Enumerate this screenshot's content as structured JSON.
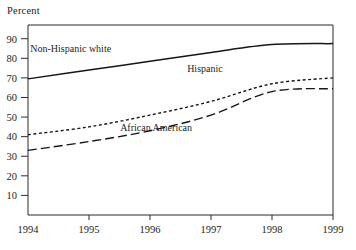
{
  "chart_data": {
    "type": "line",
    "title": "",
    "ylabel": "Percent",
    "xlabel": "",
    "x": [
      1994,
      1995,
      1996,
      1997,
      1998,
      1999
    ],
    "xtick_labels": [
      "1994",
      "1995",
      "1996",
      "1997",
      "1998",
      "1999"
    ],
    "ytick_labels": [
      "10",
      "20",
      "30",
      "40",
      "50",
      "60",
      "70",
      "80",
      "90"
    ],
    "ytick_values": [
      10,
      20,
      30,
      40,
      50,
      60,
      70,
      80,
      90
    ],
    "ylim": [
      0,
      97
    ],
    "xlim": [
      1994,
      1999
    ],
    "grid": false,
    "legend_position": "inline-annotations",
    "series": [
      {
        "name": "Non-Hispanic white",
        "style": "solid",
        "color": "#161616",
        "label_x": 1994.7,
        "label_y": 83,
        "values": [
          69.5,
          74,
          78.5,
          83,
          87,
          87.5
        ]
      },
      {
        "name": "Hispanic",
        "style": "dotted",
        "color": "#161616",
        "label_x": 1996.9,
        "label_y": 73,
        "values": [
          41,
          45,
          51,
          58,
          67,
          70
        ]
      },
      {
        "name": "African American",
        "style": "dashed",
        "color": "#161616",
        "label_x": 1996.1,
        "label_y": 43,
        "values": [
          33,
          37.5,
          43,
          51,
          63,
          64.5
        ]
      }
    ]
  },
  "axes": {
    "percent_label": "Percent"
  }
}
